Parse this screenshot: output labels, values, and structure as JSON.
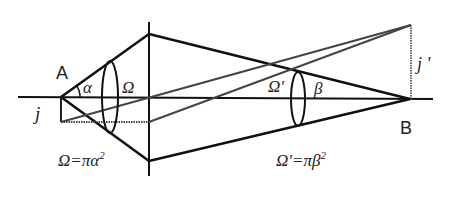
{
  "labels": {
    "A": "A",
    "B": "B",
    "j": "j",
    "j_prime": "j '",
    "alpha": "α",
    "beta": "β",
    "Omega": "Ω",
    "Omega_prime": "Ω'",
    "formula_left": "Ω=πα",
    "formula_left_exp": "2",
    "formula_right": "Ω'=πβ",
    "formula_right_exp": "2"
  },
  "colors": {
    "line": "#111111",
    "gray_ray": "#444444"
  }
}
